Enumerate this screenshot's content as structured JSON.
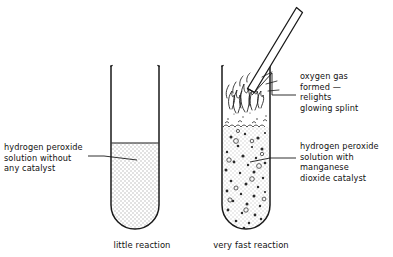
{
  "figure": {
    "ink_color": "#1a1a1a",
    "liquid_fill_color": "#e9e9e9",
    "background_color": "#ffffff"
  },
  "labels": {
    "left_solution": "hydrogen peroxide\nsolution without\nany catalyst",
    "oxygen_gas": "oxygen gas\nformed —\nrelights\nglowing splint",
    "right_solution": "hydrogen peroxide\nsolution with\nmanganese\ndioxide catalyst"
  },
  "captions": {
    "left_tube": "little reaction",
    "right_tube": "very fast reaction"
  },
  "elements": {
    "left_test_tube": "test-tube",
    "right_test_tube": "test-tube",
    "glowing_splint": "wooden splint",
    "flame": "flame",
    "bubbles": "oxygen bubbles",
    "catalyst_particles": "manganese dioxide particles"
  }
}
